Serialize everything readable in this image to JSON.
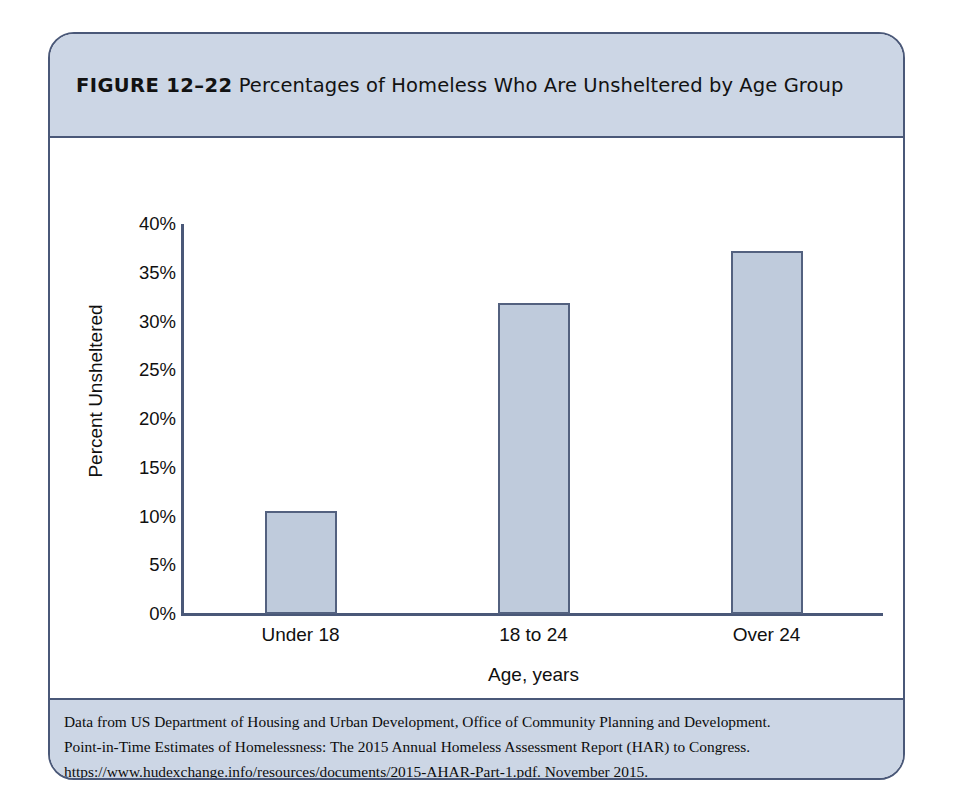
{
  "figure": {
    "number_label": "FIGURE 12–22",
    "title": "Percentages of Homeless Who Are Unsheltered by Age Group"
  },
  "source": {
    "lines": [
      "Data from US Department of Housing and Urban Development, Office of Community Planning and Development.",
      "Point-in-Time Estimates of Homelessness: The 2015 Annual Homeless Assessment Report (HAR) to Congress.",
      "https://www.hudexchange.info/resources/documents/2015-AHAR-Part-1.pdf. November 2015."
    ]
  },
  "colors": {
    "frame_border": "#4a5878",
    "band_background": "#ccd6e5",
    "bar_fill": "#bfcbdc",
    "bar_border": "#53617f",
    "axis": "#4a5878",
    "text": "#101010"
  },
  "chart_data": {
    "type": "bar",
    "title": "Percentages of Homeless Who Are Unsheltered by Age Group",
    "xlabel": "Age, years",
    "ylabel": "Percent Unsheltered",
    "categories": [
      "Under 18",
      "18 to 24",
      "Over 24"
    ],
    "values": [
      10.6,
      31.9,
      37.2
    ],
    "ylim": [
      0,
      40
    ],
    "ytick_values": [
      0,
      5,
      10,
      15,
      20,
      25,
      30,
      35,
      40
    ],
    "ytick_labels": [
      "0%",
      "5%",
      "10%",
      "15%",
      "20%",
      "25%",
      "30%",
      "35%",
      "40%"
    ],
    "grid": false,
    "legend": false
  }
}
